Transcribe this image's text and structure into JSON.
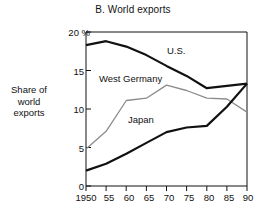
{
  "chart_data": {
    "type": "line",
    "title": "B. World exports",
    "xlabel": "",
    "ylabel": "Share of world exports",
    "ylabel_lines": [
      "Share of",
      "world",
      "exports"
    ],
    "x": [
      1950,
      1955,
      1960,
      1965,
      1970,
      1975,
      1980,
      1985,
      1990
    ],
    "x_tick_labels": [
      "1950",
      "55",
      "60",
      "65",
      "70",
      "75",
      "80",
      "85",
      "90"
    ],
    "y_ticks": [
      0,
      5,
      10,
      15,
      20
    ],
    "y_tick_labels": [
      "0",
      "5",
      "10",
      "15",
      "20"
    ],
    "y_unit_label": "%",
    "y_top_label": "20 %",
    "ylim": [
      0,
      20
    ],
    "xlim": [
      1950,
      1990
    ],
    "grid": false,
    "legend": "inline-annotations",
    "series": [
      {
        "name": "U.S.",
        "color": "#111111",
        "width": 2.2,
        "values": [
          18.3,
          18.8,
          18.1,
          17.0,
          15.6,
          14.3,
          12.7,
          13.0,
          13.3
        ]
      },
      {
        "name": "West Germany",
        "color": "#8c8c8c",
        "width": 1.3,
        "values": [
          4.8,
          7.1,
          11.1,
          11.4,
          13.1,
          12.4,
          11.4,
          11.3,
          9.6
        ]
      },
      {
        "name": "Japan",
        "color": "#111111",
        "width": 2.2,
        "values": [
          2.0,
          2.9,
          4.2,
          5.6,
          7.0,
          7.6,
          7.8,
          10.3,
          13.3
        ]
      }
    ],
    "annotations": [
      {
        "text": "U.S.",
        "series": "U.S."
      },
      {
        "text": "West Germany",
        "series": "West Germany"
      },
      {
        "text": "Japan",
        "series": "Japan"
      }
    ]
  }
}
